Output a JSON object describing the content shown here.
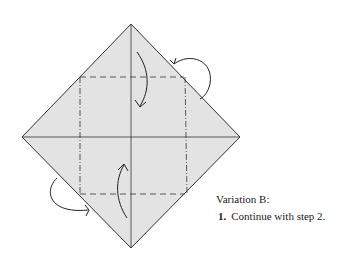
{
  "diagram": {
    "type": "origami-fold-diagram",
    "paper_color": "#e3e3e3",
    "line_color": "#333333",
    "shape": "square rotated 45° (diamond) with center creases",
    "folds": [
      {
        "type": "valley",
        "description": "top corner folds down to center"
      },
      {
        "type": "valley",
        "description": "bottom corner folds up to center"
      },
      {
        "type": "mountain",
        "description": "right-top corner folds behind"
      },
      {
        "type": "mountain",
        "description": "left-bottom corner folds behind"
      }
    ]
  },
  "text": {
    "caption": "Variation B:",
    "step_number": "1.",
    "step_text": "Continue with step 2."
  }
}
